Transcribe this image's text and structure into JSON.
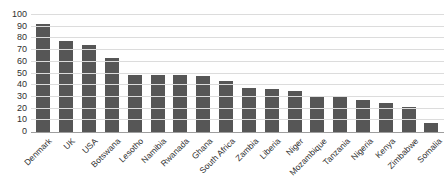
{
  "chart_data": {
    "type": "bar",
    "title": "",
    "xlabel": "",
    "ylabel": "",
    "categories": [
      "Denmark",
      "UK",
      "USA",
      "Botswana",
      "Lesotho",
      "Namibia",
      "Rwanada",
      "Ghana",
      "South Africa",
      "Zambia",
      "Liberia",
      "Niger",
      "Mozambique",
      "Tanzania",
      "Nigeria",
      "Kenya",
      "Zimbabwe",
      "Somalia"
    ],
    "values": [
      92,
      78,
      74,
      63,
      49,
      49,
      49,
      48,
      44,
      38,
      37,
      35,
      31,
      31,
      27,
      25,
      21,
      8
    ],
    "ylim": [
      0,
      100
    ],
    "yticks": [
      "0",
      "10",
      "20",
      "30",
      "40",
      "50",
      "60",
      "70",
      "80",
      "90",
      "100"
    ],
    "grid": true,
    "legend": false,
    "x_label_rotation_deg": 45,
    "colors": {
      "bar": "#565656",
      "gridline": "#dcdcdc",
      "axis_line": "#9e9e9e",
      "label_text": "#303030",
      "background": "#ffffff"
    }
  }
}
